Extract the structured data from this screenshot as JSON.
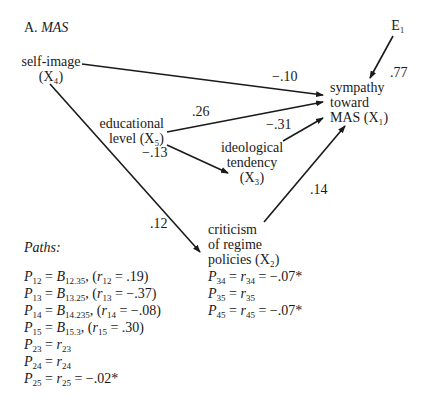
{
  "title": {
    "prefix": "A.",
    "name": "MAS"
  },
  "nodes": {
    "x4": {
      "label": "self-image",
      "var": "(X₄)"
    },
    "x5": {
      "label1": "educational",
      "label2": "level (X₅)"
    },
    "x3": {
      "label1": "ideological",
      "label2": "tendency",
      "var": "(X₃)"
    },
    "x2": {
      "label1": "criticism",
      "label2": "of regime",
      "label3": "policies (X₂)"
    },
    "x1": {
      "label1": "sympathy",
      "label2": "toward",
      "label3": "MAS (X₁)"
    },
    "e1": {
      "label": "E₁"
    }
  },
  "coefficients": {
    "x4_x1": "−.10",
    "x5_x1": ".26",
    "x3_x1": "−.31",
    "x5_x3": "−.13",
    "x4_x2": ".12",
    "x2_x1": ".14",
    "e1_x1": ".77"
  },
  "paths_heading": "Paths:",
  "equations_left": [
    {
      "p": "12",
      "rhs": "B",
      "b": "12.35",
      "rsub": "12",
      "rval": ".19"
    },
    {
      "p": "13",
      "rhs": "B",
      "b": "13.25",
      "rsub": "13",
      "rval": "−.37"
    },
    {
      "p": "14",
      "rhs": "B",
      "b": "14.235",
      "rsub": "14",
      "rval": "−.08"
    },
    {
      "p": "15",
      "rhs": "B",
      "b": "15.3",
      "rsub": "15",
      "rval": ".30"
    },
    {
      "p": "23",
      "rsub": "23"
    },
    {
      "p": "24",
      "rsub": "24"
    },
    {
      "p": "25",
      "rsub": "25",
      "val": "−.02*"
    }
  ],
  "equations_right": [
    {
      "p": "34",
      "rsub": "34",
      "val": "−.07*"
    },
    {
      "p": "35",
      "rsub": "35"
    },
    {
      "p": "45",
      "rsub": "45",
      "val": "−.07*"
    }
  ]
}
